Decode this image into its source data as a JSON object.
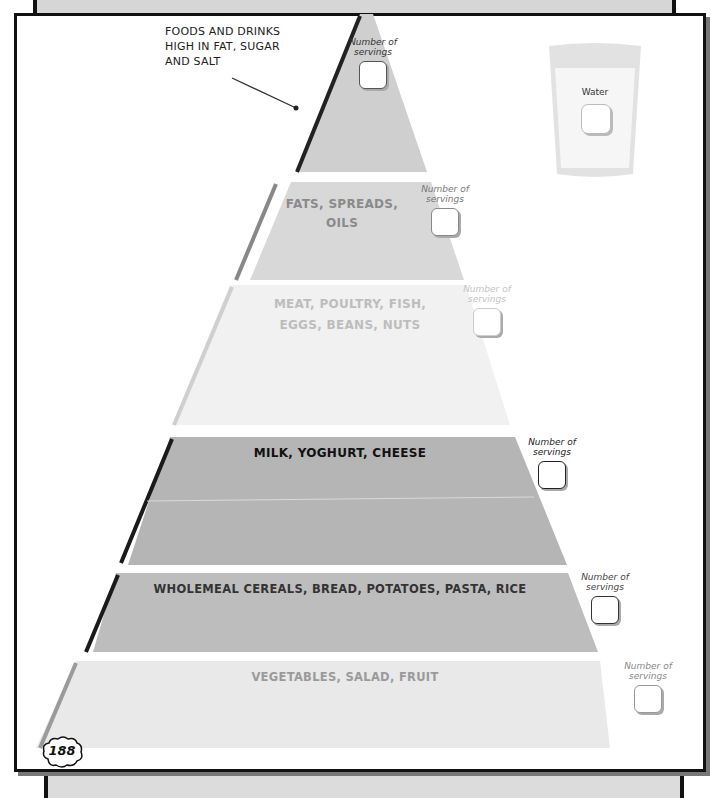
{
  "page": {
    "page_number": "188",
    "colors": {
      "border": "#111111",
      "top_band": "#cfcfcf",
      "fats_band": "#d8d8d8",
      "meat_band": "#f0f0f0",
      "milk_band": "#b5b5b5",
      "cereals_band": "#bdbdbd",
      "veg_band": "#e8e8e8"
    }
  },
  "annotation": {
    "lines": [
      "FOODS AND DRINKS",
      "HIGH IN FAT, SUGAR",
      "AND SALT"
    ]
  },
  "water": {
    "label": "Water"
  },
  "pyramid": {
    "levels": [
      {
        "id": "top",
        "label": "",
        "servings_label_1": "Number of",
        "servings_label_2": "servings"
      },
      {
        "id": "fats",
        "label_1": "FATS, SPREADS,",
        "label_2": "OILS",
        "servings_label_1": "Number of",
        "servings_label_2": "servings"
      },
      {
        "id": "meat",
        "label_1": "MEAT, POULTRY, FISH,",
        "label_2": "EGGS, BEANS, NUTS",
        "servings_label_1": "Number of",
        "servings_label_2": "servings"
      },
      {
        "id": "milk",
        "label_1": "MILK, YOGHURT, CHEESE",
        "servings_label_1": "Number of",
        "servings_label_2": "servings"
      },
      {
        "id": "cereals",
        "label_1": "WHOLEMEAL CEREALS, BREAD, POTATOES, PASTA, RICE",
        "servings_label_1": "Number of",
        "servings_label_2": "servings"
      },
      {
        "id": "veg",
        "label_1": "VEGETABLES, SALAD, FRUIT",
        "servings_label_1": "Number of",
        "servings_label_2": "servings"
      }
    ]
  }
}
